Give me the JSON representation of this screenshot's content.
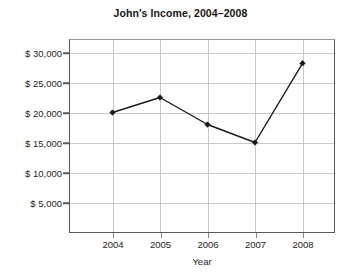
{
  "chart_data": {
    "type": "line",
    "title": "John's Income, 2004–2008",
    "xlabel": "Year",
    "ylabel": "",
    "categories": [
      "2004",
      "2005",
      "2006",
      "2007",
      "2008"
    ],
    "x": [
      2004,
      2005,
      2006,
      2007,
      2008
    ],
    "values": [
      20000,
      22500,
      18000,
      15000,
      28200
    ],
    "series": [
      {
        "name": "John's Income",
        "values": [
          20000,
          22500,
          18000,
          15000,
          28200
        ]
      }
    ],
    "ylim": [
      0,
      32000
    ],
    "xlim": [
      2003.5,
      2008.5
    ],
    "y_tick_values": [
      5000,
      10000,
      15000,
      20000,
      25000,
      30000
    ],
    "y_tick_labels": [
      "$ 5,000",
      "$ 10,000",
      "$ 15,000",
      "$ 20,000",
      "$ 25,000",
      "$ 30,000"
    ],
    "x_tick_labels": [
      "2004",
      "2005",
      "2006",
      "2007",
      "2008"
    ],
    "grid": true,
    "grid_axis": "both",
    "legend": false,
    "legend_position": "none",
    "marker": "filled-diamond",
    "line_color": "#1a1a1a",
    "marker_color": "#1a1a1a",
    "grid_color": "#c9c9c9",
    "axis_color": "#585858",
    "background_color": "#ffffff",
    "annotations": []
  },
  "axes": {
    "x_title": "Year"
  }
}
